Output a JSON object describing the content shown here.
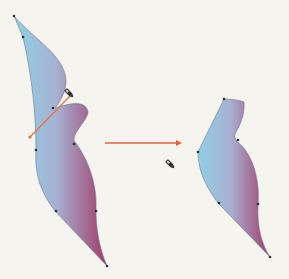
{
  "diagram": {
    "description": "Knife tool cut: shape before and after",
    "before_shape": {
      "label": "",
      "gradient": {
        "start": "#92cde0",
        "end": "#a23e6c"
      }
    },
    "cut_line": {
      "color": "#e0784e"
    },
    "arrow": {
      "color": "#e8603e",
      "direction": "right"
    },
    "after_shape": {
      "label": "",
      "gradient": {
        "start": "#92cde0",
        "end": "#a23e6c"
      }
    },
    "icons": [
      "knife-cursor-icon",
      "knife-cursor-icon"
    ],
    "colors": {
      "background": "#f6f4ee",
      "anchor_point": "#2a2f3a",
      "outline": "#5a6a80"
    }
  }
}
